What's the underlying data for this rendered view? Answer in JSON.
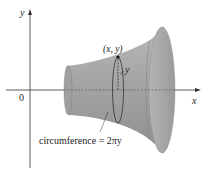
{
  "diagram": {
    "axes": {
      "x_label": "x",
      "y_label": "y",
      "origin_label": "0"
    },
    "point_label": "(x, y)",
    "radius_label": "y",
    "circumference_label": "circumference = 2πy",
    "colors": {
      "surface": "#a8a8a8",
      "surface_dark": "#8c8c8c",
      "surface_light": "#c4c4c4",
      "axis": "#333333",
      "text": "#222222"
    }
  }
}
